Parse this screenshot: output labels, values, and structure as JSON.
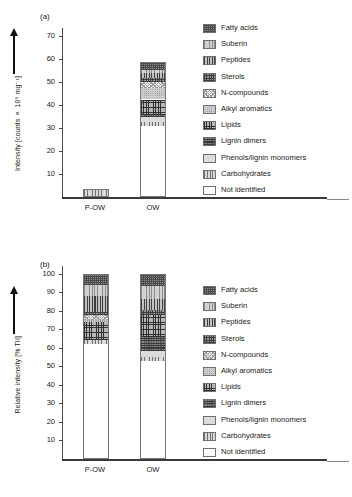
{
  "figure": {
    "panels": [
      {
        "tag": "(a)"
      },
      {
        "tag": "(b)"
      }
    ]
  },
  "categories": [
    {
      "key": "fatty_acids",
      "label": "Fatty acids",
      "pattern": "p-fatty"
    },
    {
      "key": "suberin",
      "label": "Suberin",
      "pattern": "p-suberin"
    },
    {
      "key": "peptides",
      "label": "Peptides",
      "pattern": "p-peptides"
    },
    {
      "key": "sterols",
      "label": "Sterols",
      "pattern": "p-sterols"
    },
    {
      "key": "n_compounds",
      "label": "N-compounds",
      "pattern": "p-ncomp"
    },
    {
      "key": "alkyl_aromatics",
      "label": "Alkyl aromatics",
      "pattern": "p-alkyl"
    },
    {
      "key": "lipids",
      "label": "Lipids",
      "pattern": "p-lipids"
    },
    {
      "key": "lignin_dimers",
      "label": "Lignin dimers",
      "pattern": "p-lignind"
    },
    {
      "key": "phenols_lignin_monomers",
      "label": "Phenols/lignin monomers",
      "pattern": "p-phenols"
    },
    {
      "key": "carbohydrates",
      "label": "Carbohydrates",
      "pattern": "p-carb"
    },
    {
      "key": "not_identified",
      "label": "Not identified",
      "pattern": "p-notid"
    }
  ],
  "chart_data": [
    {
      "type": "bar",
      "panel": "(a)",
      "stacked": true,
      "title": "",
      "xlabel": "",
      "ylabel": "Intensity [counts × 10⁵ mg⁻¹]",
      "ylim": [
        0,
        72
      ],
      "yticks": [
        10,
        20,
        30,
        40,
        50,
        60,
        70
      ],
      "grid": false,
      "legend_position": "right",
      "categories": [
        "P-OW",
        "OW"
      ],
      "series": [
        {
          "name": "Not identified",
          "values": [
            0.0,
            31.0
          ]
        },
        {
          "name": "Carbohydrates",
          "values": [
            3.5,
            1.6
          ]
        },
        {
          "name": "Phenols/lignin monomers",
          "values": [
            0.0,
            2.0
          ]
        },
        {
          "name": "Lignin dimers",
          "values": [
            0.0,
            1.1
          ]
        },
        {
          "name": "Lipids",
          "values": [
            0.0,
            6.6
          ]
        },
        {
          "name": "Alkyl aromatics",
          "values": [
            0.0,
            5.2
          ]
        },
        {
          "name": "N-compounds",
          "values": [
            0.0,
            2.4
          ]
        },
        {
          "name": "Sterols",
          "values": [
            0.0,
            1.6
          ]
        },
        {
          "name": "Peptides",
          "values": [
            0.0,
            2.4
          ]
        },
        {
          "name": "Suberin",
          "values": [
            0.0,
            1.3
          ]
        },
        {
          "name": "Fatty acids",
          "values": [
            0.0,
            3.3
          ]
        }
      ],
      "totals": [
        3.5,
        58.5
      ]
    },
    {
      "type": "bar",
      "panel": "(b)",
      "stacked": true,
      "title": "",
      "xlabel": "",
      "ylabel": "Relative intensity [% TII]",
      "ylim": [
        0,
        102
      ],
      "yticks": [
        10,
        20,
        30,
        40,
        50,
        60,
        70,
        80,
        90,
        100
      ],
      "grid": false,
      "legend_position": "right",
      "categories": [
        "P-OW",
        "OW"
      ],
      "series": [
        {
          "name": "Not identified",
          "values": [
            62.0,
            53.0
          ]
        },
        {
          "name": "Carbohydrates",
          "values": [
            2.0,
            2.0
          ]
        },
        {
          "name": "Phenols/lignin monomers",
          "values": [
            0.0,
            3.5
          ]
        },
        {
          "name": "Lignin dimers",
          "values": [
            0.0,
            7.5
          ]
        },
        {
          "name": "Lipids",
          "values": [
            10.0,
            11.5
          ]
        },
        {
          "name": "Alkyl aromatics",
          "values": [
            1.0,
            0.0
          ]
        },
        {
          "name": "N-compounds",
          "values": [
            2.5,
            0.0
          ]
        },
        {
          "name": "Sterols",
          "values": [
            2.0,
            3.0
          ]
        },
        {
          "name": "Peptides",
          "values": [
            8.5,
            6.0
          ]
        },
        {
          "name": "Suberin",
          "values": [
            6.0,
            7.0
          ]
        },
        {
          "name": "Fatty acids",
          "values": [
            6.0,
            6.5
          ]
        }
      ],
      "totals": [
        100.0,
        100.0
      ]
    }
  ]
}
